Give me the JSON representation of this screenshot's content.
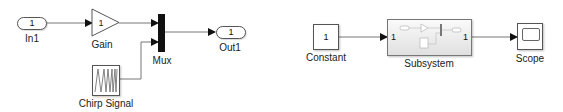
{
  "diagram": {
    "left": {
      "in1": {
        "value": "1",
        "label": "In1"
      },
      "gain": {
        "value": "1",
        "label": "Gain"
      },
      "mux": {
        "label": "Mux"
      },
      "out1": {
        "value": "1",
        "label": "Out1"
      },
      "chirp": {
        "label": "Chirp Signal"
      }
    },
    "right": {
      "constant": {
        "value": "1",
        "label": "Constant"
      },
      "subsystem": {
        "label": "Subsystem",
        "in_port": "1",
        "out_port": "1"
      },
      "scope": {
        "label": "Scope"
      }
    }
  },
  "colors": {
    "line": "#555555",
    "mux": "#111111"
  }
}
